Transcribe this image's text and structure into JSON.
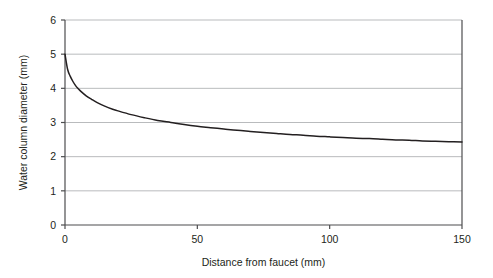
{
  "chart_data": {
    "type": "line",
    "title": "",
    "xlabel": "Distance from faucet (mm)",
    "ylabel": "Water column diameter (mm)",
    "xlim": [
      0,
      150
    ],
    "ylim": [
      0,
      6
    ],
    "xticks": [
      0,
      50,
      100,
      150
    ],
    "yticks": [
      0,
      1,
      2,
      3,
      4,
      5,
      6
    ],
    "xtick_labels": [
      "0",
      "50",
      "100",
      "150"
    ],
    "ytick_labels": [
      "0",
      "1",
      "2",
      "3",
      "4",
      "5",
      "6"
    ],
    "grid": "horizontal",
    "legend": "none",
    "series": [
      {
        "name": "Water column diameter",
        "color": "#231f20",
        "x": [
          0,
          1,
          2,
          3,
          4,
          5,
          6,
          8,
          10,
          12,
          15,
          18,
          20,
          25,
          30,
          35,
          40,
          45,
          50,
          55,
          60,
          65,
          70,
          75,
          80,
          85,
          90,
          95,
          100,
          105,
          110,
          115,
          120,
          125,
          130,
          135,
          140,
          145,
          150
        ],
        "y": [
          5.0,
          4.55,
          4.35,
          4.2,
          4.08,
          3.99,
          3.91,
          3.78,
          3.68,
          3.59,
          3.48,
          3.39,
          3.34,
          3.23,
          3.14,
          3.06,
          3.0,
          2.94,
          2.89,
          2.85,
          2.81,
          2.77,
          2.74,
          2.71,
          2.68,
          2.65,
          2.63,
          2.6,
          2.58,
          2.56,
          2.54,
          2.53,
          2.51,
          2.49,
          2.48,
          2.46,
          2.45,
          2.44,
          2.43
        ]
      }
    ]
  },
  "axes": {
    "x_title": "Distance from faucet (mm)",
    "y_title": "Water column diameter (mm)",
    "x_tick_labels": [
      "0",
      "50",
      "100",
      "150"
    ],
    "y_tick_labels": [
      "0",
      "1",
      "2",
      "3",
      "4",
      "5",
      "6"
    ]
  },
  "colors": {
    "curve": "#231f20",
    "axis": "#4d4d4f",
    "grid": "#a7a9ac",
    "background": "#ffffff"
  }
}
